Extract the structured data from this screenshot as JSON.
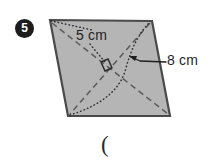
{
  "problem": {
    "number": "5",
    "marker_style": "filled-circle-white-numeral"
  },
  "figure": {
    "shape_name": "parallelogram",
    "fill_color": "#b5b5b5",
    "stroke_color": "#4a4a4a",
    "diagonal_style": "dashed",
    "height_style": "dotted",
    "right_angle_marker": true,
    "vertices": {
      "top_left": [
        50,
        20
      ],
      "top_right": [
        152,
        21
      ],
      "bottom_right": [
        170,
        116
      ],
      "bottom_left": [
        68,
        116
      ]
    },
    "center": [
      110,
      68
    ]
  },
  "labels": {
    "side_label": "5 cm",
    "height_label": "8 cm"
  },
  "answer": {
    "paren": "("
  }
}
